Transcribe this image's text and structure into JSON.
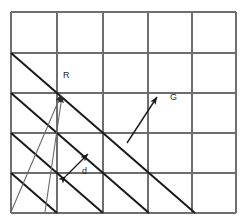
{
  "figure": {
    "type": "diagram",
    "title": "",
    "background_color": "#ffffff",
    "grid": {
      "color": "#6e6e6e",
      "line_width": 1.1,
      "x_lines": [
        11,
        57,
        103,
        148,
        192,
        236
      ],
      "y_lines": [
        12,
        53,
        93,
        133,
        173,
        213
      ],
      "columns": 5,
      "rows": 5
    },
    "planes": {
      "color": "#1a1a1a",
      "line_width": 2.0,
      "count": 4,
      "slope_dx": 46,
      "slope_dy": 40,
      "start_points": [
        {
          "x": 11,
          "y": 53
        },
        {
          "x": 11,
          "y": 93
        },
        {
          "x": 11,
          "y": 133
        },
        {
          "x": 11,
          "y": 173
        }
      ]
    },
    "vectors": [
      {
        "name": "R",
        "label": "R",
        "style": "thin-arrow",
        "color": "#6a6a6a",
        "head_at": {
          "x": 62,
          "y": 93
        },
        "tails": [
          {
            "x": 11,
            "y": 212
          },
          {
            "x": 45,
            "y": 212
          }
        ],
        "label_pos": {
          "x": 63,
          "y": 71
        }
      },
      {
        "name": "G",
        "label": "G",
        "style": "arrow",
        "color": "#1a1a1a",
        "from": {
          "x": 127,
          "y": 143
        },
        "to": {
          "x": 157,
          "y": 97
        },
        "label_pos": {
          "x": 170,
          "y": 93
        }
      },
      {
        "name": "d",
        "label": "d",
        "style": "double-arrow",
        "color": "#1a1a1a",
        "from": {
          "x": 64,
          "y": 178
        },
        "to": {
          "x": 90,
          "y": 152
        },
        "label_pos": {
          "x": 82,
          "y": 167
        }
      }
    ],
    "labels": {
      "R": "R",
      "G": "G",
      "d": "d"
    }
  }
}
